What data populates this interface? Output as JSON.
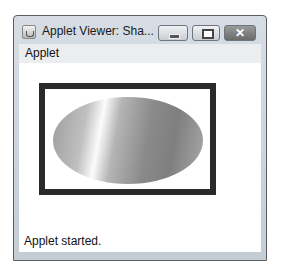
{
  "window": {
    "title": "Applet Viewer: Sha...",
    "icon": "java-cup-icon",
    "controls": {
      "minimize": "minimize-icon",
      "maximize": "maximize-icon",
      "close": "close-icon",
      "close_glyph": "✕"
    }
  },
  "menubar": {
    "items": [
      {
        "label": "Applet"
      }
    ]
  },
  "canvas": {
    "shapes": [
      {
        "type": "rectangle",
        "stroke": "#2a2a2a",
        "stroke_width": 6
      },
      {
        "type": "ellipse",
        "fill": "gradient",
        "colors": [
          "#9c9c9c",
          "#fbfbfb",
          "#7f7f7f"
        ]
      }
    ]
  },
  "status": {
    "text": "Applet started."
  }
}
